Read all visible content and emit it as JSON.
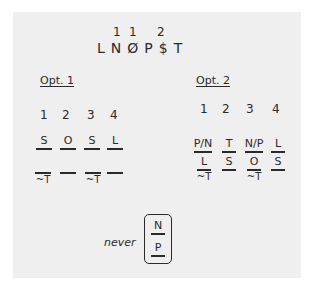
{
  "header": {
    "counts": [
      {
        "label": "1",
        "x": 119
      },
      {
        "label": "1",
        "x": 132
      },
      {
        "label": "2",
        "x": 160
      }
    ],
    "letters": [
      "L",
      "N",
      "Ø",
      "P",
      "$",
      "T"
    ]
  },
  "option1": {
    "title": "Opt. 1",
    "columns": [
      "1",
      "2",
      "3",
      "4"
    ],
    "row1": [
      {
        "val": "S",
        "sub": ""
      },
      {
        "val": "O",
        "sub": ""
      },
      {
        "val": "S",
        "sub": ""
      },
      {
        "val": "L",
        "sub": ""
      }
    ],
    "row2": [
      {
        "val": "",
        "sub": "~T"
      },
      {
        "val": "",
        "sub": ""
      },
      {
        "val": "",
        "sub": "~T"
      },
      {
        "val": "",
        "sub": ""
      }
    ]
  },
  "option2": {
    "title": "Opt. 2",
    "columns": [
      "1",
      "2",
      "3",
      "4"
    ],
    "row1": [
      {
        "val": "P/N",
        "sub": ""
      },
      {
        "val": "T",
        "sub": ""
      },
      {
        "val": "N/P",
        "sub": ""
      },
      {
        "val": "L",
        "sub": ""
      }
    ],
    "row2": [
      {
        "val": "L",
        "sub": "~T"
      },
      {
        "val": "S",
        "sub": ""
      },
      {
        "val": "O",
        "sub": "~T"
      },
      {
        "val": "S",
        "sub": ""
      }
    ]
  },
  "constraint": {
    "label": "never",
    "top": "N",
    "bottom": "P"
  }
}
